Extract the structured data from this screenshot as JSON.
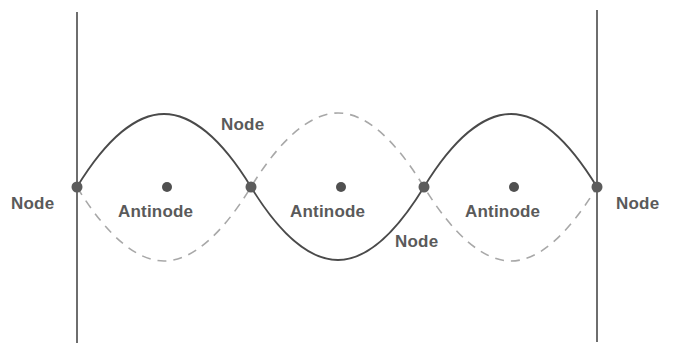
{
  "diagram": {
    "title": "",
    "colors": {
      "background": "#ffffff",
      "boundary_line": "#4a4a4a",
      "solid_wave": "#4a4a4a",
      "dashed_wave": "#a8a8a8",
      "point": "#5c5c5c",
      "text": "#5a5a5a"
    },
    "boundaries": [
      {
        "x": 77,
        "y_top": 12,
        "y_bottom": 343
      },
      {
        "x": 597,
        "y_top": 10,
        "y_bottom": 342
      }
    ],
    "centerline_y": 187,
    "amplitude": 73,
    "nodes_x": [
      77,
      251,
      424,
      597
    ],
    "antinodes_x": [
      167,
      341,
      514
    ],
    "labels": {
      "node_left": "Node",
      "node_top": "Node",
      "node_bottom": "Node",
      "node_right": "Node",
      "antinode_1": "Antinode",
      "antinode_2": "Antinode",
      "antinode_3": "Antinode"
    }
  }
}
